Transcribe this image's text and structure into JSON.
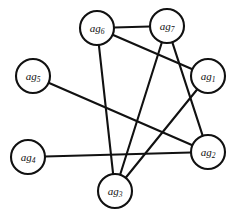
{
  "figure": {
    "name": "agent-interaction-graph",
    "type": "undirected-node-link-graph",
    "background_color": "#ffffff",
    "stroke_color": "#111111",
    "node_fill_color": "#ffffff",
    "width": 233,
    "height": 222
  },
  "graph_data": {
    "type": "graph",
    "directed": false,
    "node_count": 7,
    "edge_count": 8,
    "nodes": [
      {
        "id": "ag1",
        "base": "ag",
        "subscript": "1",
        "label": "ag1",
        "cx": 208,
        "cy": 76,
        "r": 17
      },
      {
        "id": "ag2",
        "base": "ag",
        "subscript": "2",
        "label": "ag2",
        "cx": 208,
        "cy": 152,
        "r": 17
      },
      {
        "id": "ag3",
        "base": "ag",
        "subscript": "3",
        "label": "ag3",
        "cx": 115,
        "cy": 191,
        "r": 17
      },
      {
        "id": "ag4",
        "base": "ag",
        "subscript": "4",
        "label": "ag4",
        "cx": 28,
        "cy": 157,
        "r": 17
      },
      {
        "id": "ag5",
        "base": "ag",
        "subscript": "5",
        "label": "ag5",
        "cx": 33,
        "cy": 76,
        "r": 17
      },
      {
        "id": "ag6",
        "base": "ag",
        "subscript": "6",
        "label": "ag6",
        "cx": 97,
        "cy": 28,
        "r": 17
      },
      {
        "id": "ag7",
        "base": "ag",
        "subscript": "7",
        "label": "ag7",
        "cx": 167,
        "cy": 26,
        "r": 17
      }
    ],
    "edges": [
      {
        "source": "ag6",
        "target": "ag7"
      },
      {
        "source": "ag6",
        "target": "ag1"
      },
      {
        "source": "ag6",
        "target": "ag3"
      },
      {
        "source": "ag7",
        "target": "ag3"
      },
      {
        "source": "ag7",
        "target": "ag2"
      },
      {
        "source": "ag1",
        "target": "ag3"
      },
      {
        "source": "ag5",
        "target": "ag2"
      },
      {
        "source": "ag4",
        "target": "ag2"
      }
    ]
  }
}
